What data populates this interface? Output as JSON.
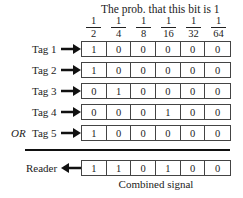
{
  "header": {
    "title": "The prob. that this bit is 1",
    "probabilities": [
      {
        "num": "1",
        "den": "2"
      },
      {
        "num": "1",
        "den": "4"
      },
      {
        "num": "1",
        "den": "8"
      },
      {
        "num": "1",
        "den": "16"
      },
      {
        "num": "1",
        "den": "32"
      },
      {
        "num": "1",
        "den": "64"
      }
    ]
  },
  "tags": [
    {
      "label": "Tag 1",
      "prefix": "",
      "bits": [
        "1",
        "0",
        "0",
        "0",
        "0",
        "0"
      ]
    },
    {
      "label": "Tag 2",
      "prefix": "",
      "bits": [
        "1",
        "0",
        "0",
        "0",
        "0",
        "0"
      ]
    },
    {
      "label": "Tag 3",
      "prefix": "",
      "bits": [
        "0",
        "1",
        "0",
        "0",
        "0",
        "0"
      ]
    },
    {
      "label": "Tag 4",
      "prefix": "",
      "bits": [
        "0",
        "0",
        "0",
        "1",
        "0",
        "0"
      ]
    },
    {
      "label": "Tag 5",
      "prefix": "OR",
      "bits": [
        "1",
        "0",
        "0",
        "0",
        "0",
        "0"
      ]
    }
  ],
  "reader": {
    "label": "Reader",
    "bits": [
      "1",
      "1",
      "0",
      "1",
      "0",
      "0"
    ],
    "caption": "Combined signal"
  }
}
